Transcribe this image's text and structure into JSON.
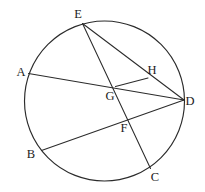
{
  "diagram": {
    "canvas": {
      "width": 205,
      "height": 192
    },
    "background_color": "#ffffff",
    "stroke_color": "#2b2b2b",
    "label_color": "#1c1c1c",
    "circle": {
      "center_x": 104.5,
      "center_y": 101,
      "radius": 80,
      "stroke_width": 1.15
    },
    "points": [
      {
        "id": "A",
        "label": "A",
        "x": 28.5,
        "y": 73.5,
        "label_x": 21,
        "label_y": 76,
        "on_circle": true
      },
      {
        "id": "B",
        "label": "B",
        "x": 41.5,
        "y": 150.5,
        "label_x": 31,
        "label_y": 158,
        "on_circle": true
      },
      {
        "id": "C",
        "label": "C",
        "x": 150.5,
        "y": 168.5,
        "label_x": 155,
        "label_y": 181,
        "on_circle": true
      },
      {
        "id": "D",
        "label": "D",
        "x": 184.0,
        "y": 100.0,
        "label_x": 190,
        "label_y": 105,
        "on_circle": true
      },
      {
        "id": "E",
        "label": "E",
        "x": 82.5,
        "y": 23.5,
        "label_x": 78,
        "label_y": 18,
        "on_circle": true
      },
      {
        "id": "F",
        "label": "F",
        "x": 129.0,
        "y": 118.5,
        "label_x": 124,
        "label_y": 132,
        "on_circle": false
      },
      {
        "id": "G",
        "label": "G",
        "x": 115.5,
        "y": 86.5,
        "label_x": 110,
        "label_y": 100,
        "on_circle": false
      },
      {
        "id": "H",
        "label": "H",
        "x": 148.0,
        "y": 78.0,
        "label_x": 152,
        "label_y": 74,
        "on_circle": false
      }
    ],
    "segments": [
      {
        "id": "AD",
        "name": "chord-a-d",
        "from": "A",
        "to": "D",
        "passes_through": [
          "G"
        ]
      },
      {
        "id": "BD",
        "name": "chord-b-d",
        "from": "B",
        "to": "D",
        "passes_through": [
          "F"
        ]
      },
      {
        "id": "EC",
        "name": "chord-e-c",
        "from": "E",
        "to": "C",
        "passes_through": [
          "G",
          "F"
        ]
      },
      {
        "id": "ED",
        "name": "chord-e-d",
        "from": "E",
        "to": "D",
        "passes_through": [
          "H"
        ]
      },
      {
        "id": "GH",
        "name": "segment-g-h",
        "from": "G",
        "to": "H",
        "passes_through": []
      }
    ]
  }
}
